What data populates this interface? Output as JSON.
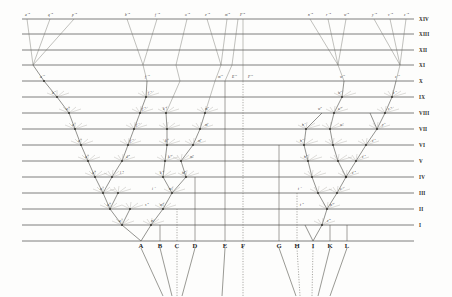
{
  "figure": {
    "background_color": "#fdfdfc",
    "line_color": "#33322e",
    "label_color": "#23221e"
  },
  "chart_data": {
    "type": "diagram",
    "xlabel": "",
    "ylabel": "",
    "grid": true,
    "legend_position": "none",
    "axis_note": "Horizontal lines are successive generations / geological horizons labelled I-XIV at right. Baseline carries ancestral species A-L.",
    "horizon_labels": [
      "I",
      "II",
      "III",
      "IV",
      "V",
      "VI",
      "VII",
      "VIII",
      "IX",
      "X",
      "XI",
      "XII",
      "XIII",
      "XIV"
    ],
    "horizon_y": [
      225,
      209,
      193,
      177,
      161,
      145,
      129,
      113,
      97,
      81,
      65,
      50,
      34,
      19
    ],
    "baseline_y": 241,
    "plot_left": 22,
    "plot_right": 414,
    "species": [
      {
        "label": "A",
        "x": 141,
        "fate": "diversifies",
        "fan": "solid"
      },
      {
        "label": "B",
        "x": 160,
        "fate": "extinct",
        "fan": "solid"
      },
      {
        "label": "C",
        "x": 177,
        "fate": "extinct",
        "fan": "dotted"
      },
      {
        "label": "D",
        "x": 195,
        "fate": "extinct",
        "fan": "solid"
      },
      {
        "label": "E",
        "x": 225,
        "fate": "unchanged to X",
        "fan": "solid"
      },
      {
        "label": "F",
        "x": 243,
        "fate": "unchanged to X",
        "fan": "dotted"
      },
      {
        "label": "G",
        "x": 279,
        "fate": "extinct at VI",
        "fan": "solid"
      },
      {
        "label": "H",
        "x": 297,
        "fate": "extinct at III",
        "fan": "dotted"
      },
      {
        "label": "I",
        "x": 313,
        "fate": "diversifies",
        "fan": "dotted"
      },
      {
        "label": "K",
        "x": 330,
        "fate": "extinct",
        "fan": "solid"
      },
      {
        "label": "L",
        "x": 347,
        "fate": "extinct",
        "fan": "solid"
      }
    ],
    "variety_labels": [
      {
        "t": "a",
        "s": "1",
        "x": 119,
        "y": 222
      },
      {
        "t": "m",
        "s": "1",
        "x": 151,
        "y": 222
      },
      {
        "t": "a",
        "s": "2",
        "x": 107,
        "y": 206
      },
      {
        "t": "m",
        "s": "2",
        "x": 160,
        "y": 206
      },
      {
        "t": "s",
        "s": "2",
        "x": 145,
        "y": 206
      },
      {
        "t": "a",
        "s": "3",
        "x": 100,
        "y": 190
      },
      {
        "t": "i",
        "s": "3",
        "x": 152,
        "y": 190
      },
      {
        "t": "m",
        "s": "3",
        "x": 169,
        "y": 190
      },
      {
        "t": "a",
        "s": "4",
        "x": 92,
        "y": 174
      },
      {
        "t": "l",
        "s": "4",
        "x": 120,
        "y": 174
      },
      {
        "t": "k",
        "s": "4",
        "x": 160,
        "y": 174
      },
      {
        "t": "m",
        "s": "4",
        "x": 182,
        "y": 174
      },
      {
        "t": "a",
        "s": "5",
        "x": 85,
        "y": 158
      },
      {
        "t": "d",
        "s": "5",
        "x": 126,
        "y": 158
      },
      {
        "t": "k",
        "s": "5",
        "x": 168,
        "y": 158
      },
      {
        "t": "m",
        "s": "5",
        "x": 190,
        "y": 158
      },
      {
        "t": "a",
        "s": "6",
        "x": 78,
        "y": 142
      },
      {
        "t": "f",
        "s": "6",
        "x": 130,
        "y": 142
      },
      {
        "t": "k",
        "s": "6",
        "x": 165,
        "y": 142
      },
      {
        "t": "m",
        "s": "6",
        "x": 198,
        "y": 142
      },
      {
        "t": "a",
        "s": "7",
        "x": 72,
        "y": 126
      },
      {
        "t": "f",
        "s": "7",
        "x": 136,
        "y": 126
      },
      {
        "t": "m",
        "s": "7",
        "x": 205,
        "y": 126
      },
      {
        "t": "a",
        "s": "8",
        "x": 66,
        "y": 110
      },
      {
        "t": "f",
        "s": "8",
        "x": 142,
        "y": 110
      },
      {
        "t": "k",
        "s": "8",
        "x": 163,
        "y": 110
      },
      {
        "t": "m",
        "s": "8",
        "x": 205,
        "y": 110
      },
      {
        "t": "a",
        "s": "9",
        "x": 52,
        "y": 94
      },
      {
        "t": "f",
        "s": "9",
        "x": 148,
        "y": 94
      },
      {
        "t": "a",
        "s": "10",
        "x": 40,
        "y": 78
      },
      {
        "t": "f",
        "s": "10",
        "x": 145,
        "y": 78
      },
      {
        "t": "m",
        "s": "10",
        "x": 218,
        "y": 78
      },
      {
        "t": "E",
        "s": "10",
        "x": 232,
        "y": 78
      },
      {
        "t": "F",
        "s": "10",
        "x": 248,
        "y": 78
      },
      {
        "t": "w",
        "s": "10",
        "x": 340,
        "y": 78
      },
      {
        "t": "z",
        "s": "10",
        "x": 395,
        "y": 78
      },
      {
        "t": "w",
        "s": "9",
        "x": 338,
        "y": 94
      },
      {
        "t": "z",
        "s": "9",
        "x": 393,
        "y": 94
      },
      {
        "t": "w",
        "s": "8",
        "x": 318,
        "y": 110
      },
      {
        "t": "u",
        "s": "8",
        "x": 338,
        "y": 110
      },
      {
        "t": "z",
        "s": "8",
        "x": 388,
        "y": 110
      },
      {
        "t": "n",
        "s": "7",
        "x": 302,
        "y": 126
      },
      {
        "t": "w",
        "s": "7",
        "x": 340,
        "y": 126
      },
      {
        "t": "y",
        "s": "7",
        "x": 382,
        "y": 126
      },
      {
        "t": "n",
        "s": "6",
        "x": 300,
        "y": 142
      },
      {
        "t": "z",
        "s": "6",
        "x": 372,
        "y": 142
      },
      {
        "t": "n",
        "s": "5",
        "x": 304,
        "y": 158
      },
      {
        "t": "z",
        "s": "5",
        "x": 362,
        "y": 158
      },
      {
        "t": "z",
        "s": "4",
        "x": 352,
        "y": 174
      },
      {
        "t": "t",
        "s": "3",
        "x": 298,
        "y": 190
      },
      {
        "t": "z",
        "s": "3",
        "x": 340,
        "y": 190
      },
      {
        "t": "t",
        "s": "2",
        "x": 300,
        "y": 206
      },
      {
        "t": "n",
        "s": "2",
        "x": 330,
        "y": 206
      },
      {
        "t": "z",
        "s": "2",
        "x": 327,
        "y": 222
      },
      {
        "t": "a",
        "s": "14",
        "x": 25,
        "y": 16
      },
      {
        "t": "q",
        "s": "14",
        "x": 48,
        "y": 16
      },
      {
        "t": "p",
        "s": "14",
        "x": 72,
        "y": 16
      },
      {
        "t": "b",
        "s": "14",
        "x": 125,
        "y": 16
      },
      {
        "t": "f",
        "s": "14",
        "x": 155,
        "y": 16
      },
      {
        "t": "o",
        "s": "14",
        "x": 185,
        "y": 16
      },
      {
        "t": "e",
        "s": "14",
        "x": 205,
        "y": 16
      },
      {
        "t": "m",
        "s": "14",
        "x": 225,
        "y": 16
      },
      {
        "t": "F",
        "s": "14",
        "x": 240,
        "y": 16
      },
      {
        "t": "n",
        "s": "14",
        "x": 308,
        "y": 16
      },
      {
        "t": "r",
        "s": "14",
        "x": 326,
        "y": 16
      },
      {
        "t": "w",
        "s": "14",
        "x": 344,
        "y": 16
      },
      {
        "t": "y",
        "s": "14",
        "x": 372,
        "y": 16
      },
      {
        "t": "v",
        "s": "14",
        "x": 388,
        "y": 16
      },
      {
        "t": "z",
        "s": "14",
        "x": 404,
        "y": 16
      }
    ]
  }
}
